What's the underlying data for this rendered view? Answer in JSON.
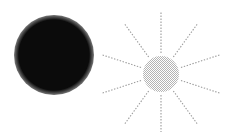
{
  "canvas": {
    "width": 226,
    "height": 132,
    "background": "#ffffff"
  },
  "figure": {
    "title": "",
    "caption": "",
    "shape_count": 2
  },
  "shapes": [
    {
      "id": "solid-disc",
      "label": "solid black circle",
      "kind": "circle",
      "fill": "#0b0b0b",
      "stroke": "none",
      "cx": 54,
      "cy": 55,
      "r": 40,
      "opacity": 1
    },
    {
      "id": "sun-disc",
      "label": "stippled gray sun disc",
      "kind": "circle",
      "fill": "#c9c9c9",
      "stroke": "none",
      "cx": 161,
      "cy": 74,
      "r": 18,
      "opacity": 1,
      "texture": "dither"
    }
  ],
  "rays": {
    "id": "sun-rays",
    "label": "radiating dotted rays",
    "count": 10,
    "angle_step_deg": 36,
    "start_angle_deg": -90,
    "inner_radius": 21,
    "outer_radius": 62,
    "color": "#9b9b9b",
    "width": 1.1,
    "dash": "1.4 1.6",
    "angles_deg": [
      -90,
      -54,
      -18,
      18,
      54,
      90,
      126,
      162,
      198,
      234
    ]
  },
  "colors": {
    "background": "#ffffff",
    "black": "#0b0b0b",
    "gray_disc": "#c9c9c9",
    "gray_ray": "#9b9b9b"
  }
}
